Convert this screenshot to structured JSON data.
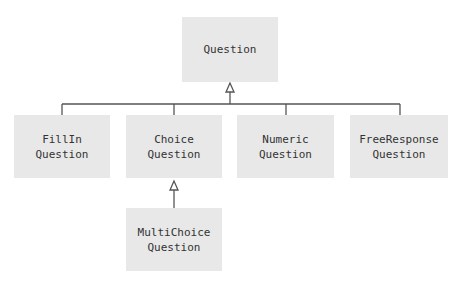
{
  "diagram": {
    "type": "uml-class-inheritance",
    "colors": {
      "box_fill": "#e8e8e8",
      "line": "#555555",
      "text": "#333333"
    },
    "nodes": [
      {
        "id": "question",
        "lines": [
          "Question"
        ]
      },
      {
        "id": "fillin",
        "lines": [
          "FillIn",
          "Question"
        ]
      },
      {
        "id": "choice",
        "lines": [
          "Choice",
          "Question"
        ]
      },
      {
        "id": "numeric",
        "lines": [
          "Numeric",
          "Question"
        ]
      },
      {
        "id": "freeresponse",
        "lines": [
          "FreeResponse",
          "Question"
        ]
      },
      {
        "id": "multichoice",
        "lines": [
          "MultiChoice",
          "Question"
        ]
      }
    ],
    "edges": [
      {
        "from": "fillin",
        "to": "question",
        "kind": "generalization"
      },
      {
        "from": "choice",
        "to": "question",
        "kind": "generalization"
      },
      {
        "from": "numeric",
        "to": "question",
        "kind": "generalization"
      },
      {
        "from": "freeresponse",
        "to": "question",
        "kind": "generalization"
      },
      {
        "from": "multichoice",
        "to": "choice",
        "kind": "generalization"
      }
    ]
  }
}
